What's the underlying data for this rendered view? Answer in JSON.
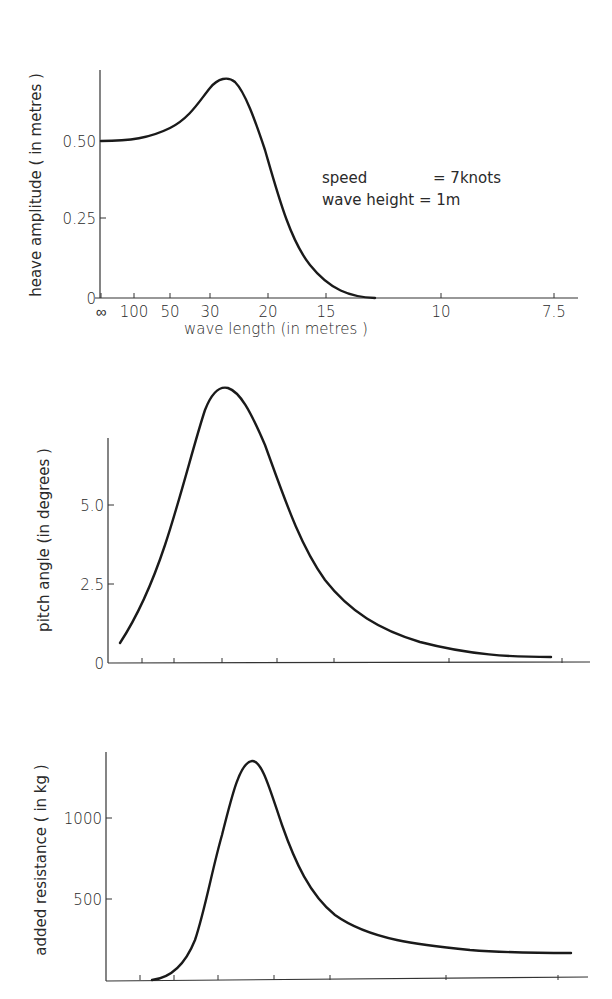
{
  "chart_data": [
    {
      "type": "line",
      "title": "",
      "xlabel": "wave length  (in metres )",
      "ylabel": "heave amplitude  ( in metres )",
      "x_tick_labels": [
        "∞",
        "100",
        "50",
        "30",
        "20",
        "15",
        "10",
        "7.5"
      ],
      "y_tick_labels": [
        "0",
        "0.25",
        "0.50"
      ],
      "ylim": [
        0,
        0.72
      ],
      "annotation": [
        "speed        = 7knots",
        "wave height = 1m"
      ],
      "series": [
        {
          "name": "heave amplitude",
          "x": [
            "∞",
            "100",
            "50",
            "30",
            "~27",
            "20",
            "15",
            "~13"
          ],
          "values": [
            0.5,
            0.51,
            0.56,
            0.68,
            0.7,
            0.42,
            0.06,
            0.0
          ]
        }
      ],
      "grid": false
    },
    {
      "type": "line",
      "title": "",
      "xlabel": "",
      "ylabel": "pitch angle  (in degrees )",
      "y_tick_labels": [
        "0",
        "2.5",
        "5.0"
      ],
      "ylim": [
        0,
        8.5
      ],
      "series": [
        {
          "name": "pitch angle",
          "x": [
            "∞",
            "100",
            "50",
            "30",
            "20",
            "15",
            "10",
            "7.5"
          ],
          "values": [
            0.6,
            2.3,
            5.4,
            8.4,
            5.5,
            2.3,
            0.5,
            0.2
          ]
        }
      ],
      "grid": false
    },
    {
      "type": "line",
      "title": "",
      "xlabel": "",
      "ylabel": "added resistance  ( in kg )",
      "y_tick_labels": [
        "500",
        "1000"
      ],
      "ylim": [
        0,
        1400
      ],
      "series": [
        {
          "name": "added resistance",
          "x": [
            "∞",
            "100",
            "50",
            "30",
            "~27",
            "20",
            "15",
            "10",
            "7.5"
          ],
          "values": [
            0,
            0,
            200,
            1050,
            1350,
            850,
            350,
            180,
            140
          ]
        }
      ],
      "grid": false
    }
  ],
  "charts": {
    "heave": {
      "ylabel": "heave amplitude  ( in metres )",
      "xlabel": "wave length  (in metres )",
      "yticks": [
        {
          "label": "0",
          "y": 298
        },
        {
          "label": "0.25",
          "y": 218
        },
        {
          "label": "0.50",
          "y": 141
        }
      ],
      "xticks": [
        {
          "label": "∞",
          "x": 101
        },
        {
          "label": "100",
          "x": 134
        },
        {
          "label": "50",
          "x": 170
        },
        {
          "label": "30",
          "x": 210
        },
        {
          "label": "20",
          "x": 268
        },
        {
          "label": "15",
          "x": 326
        },
        {
          "label": "10",
          "x": 441
        },
        {
          "label": "7.5",
          "x": 554
        }
      ],
      "annotation_line1": "speed",
      "annotation_line1_value": "= 7knots",
      "annotation_line2": "wave height = 1m",
      "path": "M101,141 C130,141 150,138 170,128 C190,118 200,100 210,88 C218,78 228,76 235,82 C245,92 255,120 265,150 C278,195 290,240 310,265 C330,290 350,297 375,298"
    },
    "pitch": {
      "ylabel": "pitch angle  (in degrees )",
      "yticks": [
        {
          "label": "0",
          "y": 663
        },
        {
          "label": "2.5",
          "y": 584
        },
        {
          "label": "5.0",
          "y": 505
        }
      ],
      "xticks": [
        142,
        174,
        222,
        277,
        334,
        449,
        562
      ],
      "path": "M120,643 C135,620 150,590 165,545 C180,500 195,440 205,410 C212,392 220,386 228,388 C240,392 250,410 265,445 C285,500 300,545 325,580 C350,612 380,630 420,642 C470,655 510,657 551,657"
    },
    "resistance": {
      "ylabel": "added resistance  ( in kg )",
      "yticks": [
        {
          "label": "500",
          "y": 899
        },
        {
          "label": "1000",
          "y": 818
        }
      ],
      "xticks": [
        140,
        174,
        218,
        274,
        330,
        446,
        558
      ],
      "path": "M152,980 C170,978 185,965 195,940 C205,910 212,870 222,835 C232,795 240,762 252,761 C262,760 270,790 282,825 C295,862 310,895 335,915 C370,940 420,945 470,950 C510,953 540,953 571,953"
    }
  }
}
